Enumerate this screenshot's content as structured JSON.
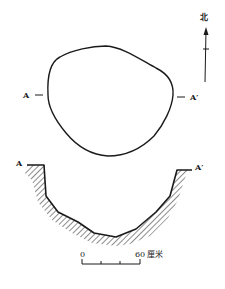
{
  "figure": {
    "plan_view": {
      "label_left": "A",
      "label_right": "A′"
    },
    "north_arrow": {
      "label": "北",
      "icon": "north-arrow-icon"
    },
    "section_view": {
      "label_left": "A",
      "label_right": "A′"
    },
    "scale_bar": {
      "start_label": "0",
      "end_label": "60",
      "unit": "厘米"
    },
    "colors": {
      "ink": "#1a1a1a",
      "background": "#ffffff"
    }
  }
}
